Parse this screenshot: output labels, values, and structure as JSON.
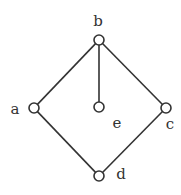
{
  "diagram": {
    "type": "hasse-diagram",
    "nodes": [
      {
        "id": "b",
        "label": "b",
        "x": 99,
        "y": 40,
        "lx": 98,
        "ly": 26
      },
      {
        "id": "a",
        "label": "a",
        "x": 34,
        "y": 108,
        "lx": 15,
        "ly": 114
      },
      {
        "id": "e",
        "label": "e",
        "x": 99,
        "y": 107,
        "lx": 117,
        "ly": 128
      },
      {
        "id": "c",
        "label": "c",
        "x": 166,
        "y": 108,
        "lx": 170,
        "ly": 129
      },
      {
        "id": "d",
        "label": "d",
        "x": 99,
        "y": 176,
        "lx": 121,
        "ly": 179
      }
    ],
    "edges": [
      {
        "from": "b",
        "to": "a"
      },
      {
        "from": "b",
        "to": "e"
      },
      {
        "from": "b",
        "to": "c"
      },
      {
        "from": "a",
        "to": "d"
      },
      {
        "from": "c",
        "to": "d"
      }
    ]
  }
}
